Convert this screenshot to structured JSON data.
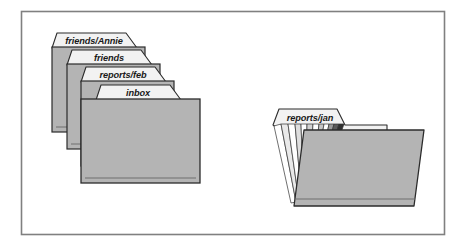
{
  "figure": {
    "border_color": "#808080",
    "background_color": "#ffffff"
  },
  "colors": {
    "folder_body": "#b4b4b4",
    "folder_body_shadow": "#9a9a9a",
    "folder_outline": "#2b2b2b",
    "tab_fill": "#f2f2f2",
    "tab_outline": "#2b2b2b",
    "label_text": "#191919",
    "page_fan_light": "#ffffff",
    "page_fan_dark": "#303030",
    "inner_rule": "#6e6e6e"
  },
  "stack": {
    "name": "closed-folder-stack",
    "folders": [
      {
        "label": "friends/Annie",
        "index": 0
      },
      {
        "label": "friends",
        "index": 1
      },
      {
        "label": "reports/feb",
        "index": 2
      },
      {
        "label": "inbox",
        "index": 3
      }
    ]
  },
  "open_folder": {
    "name": "open-folder",
    "label": "reports/jan",
    "page_count": 12
  }
}
